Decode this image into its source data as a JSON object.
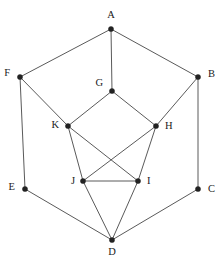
{
  "figure": {
    "width": 222,
    "height": 270,
    "background_color": "#ffffff",
    "edge_color": "#5a5a5a",
    "node_color": "#222222",
    "label_color": "#1a1a1a",
    "watermark": ""
  },
  "chart_data": {
    "type": "diagram",
    "subtype": "node-link-graph",
    "directed": false,
    "title": "",
    "xlabel": "",
    "ylabel": "",
    "grid": false,
    "legend": null,
    "node_count": 11,
    "edge_count": 18,
    "nodes": [
      {
        "id": "A",
        "label": "A",
        "x": 111,
        "y": 29,
        "label_x": 111,
        "label_y": 16,
        "label_anchor": "middle"
      },
      {
        "id": "B",
        "label": "B",
        "x": 198,
        "y": 77,
        "label_x": 208,
        "label_y": 75,
        "label_anchor": "start"
      },
      {
        "id": "C",
        "label": "C",
        "x": 198,
        "y": 189,
        "label_x": 208,
        "label_y": 190,
        "label_anchor": "start"
      },
      {
        "id": "D",
        "label": "D",
        "x": 112,
        "y": 240,
        "label_x": 112,
        "label_y": 253,
        "label_anchor": "middle"
      },
      {
        "id": "E",
        "label": "E",
        "x": 25,
        "y": 189,
        "label_x": 15,
        "label_y": 188,
        "label_anchor": "end"
      },
      {
        "id": "F",
        "label": "F",
        "x": 20,
        "y": 77,
        "label_x": 10,
        "label_y": 74,
        "label_anchor": "end"
      },
      {
        "id": "G",
        "label": "G",
        "x": 112,
        "y": 91,
        "label_x": 103,
        "label_y": 84,
        "label_anchor": "end"
      },
      {
        "id": "H",
        "label": "H",
        "x": 156,
        "y": 126,
        "label_x": 165,
        "label_y": 127,
        "label_anchor": "start"
      },
      {
        "id": "I",
        "label": "I",
        "x": 138,
        "y": 181,
        "label_x": 147,
        "label_y": 182,
        "label_anchor": "start"
      },
      {
        "id": "J",
        "label": "J",
        "x": 83,
        "y": 181,
        "label_x": 75,
        "label_y": 182,
        "label_anchor": "end"
      },
      {
        "id": "K",
        "label": "K",
        "x": 68,
        "y": 126,
        "label_x": 59,
        "label_y": 126,
        "label_anchor": "end"
      }
    ],
    "edges": [
      {
        "source": "A",
        "target": "F"
      },
      {
        "source": "A",
        "target": "B"
      },
      {
        "source": "A",
        "target": "G"
      },
      {
        "source": "F",
        "target": "E"
      },
      {
        "source": "F",
        "target": "K"
      },
      {
        "source": "B",
        "target": "C"
      },
      {
        "source": "B",
        "target": "H"
      },
      {
        "source": "G",
        "target": "K"
      },
      {
        "source": "G",
        "target": "H"
      },
      {
        "source": "E",
        "target": "D"
      },
      {
        "source": "C",
        "target": "D"
      },
      {
        "source": "K",
        "target": "J"
      },
      {
        "source": "K",
        "target": "I"
      },
      {
        "source": "H",
        "target": "J"
      },
      {
        "source": "H",
        "target": "I"
      },
      {
        "source": "J",
        "target": "I"
      },
      {
        "source": "J",
        "target": "D"
      },
      {
        "source": "I",
        "target": "D"
      }
    ]
  }
}
